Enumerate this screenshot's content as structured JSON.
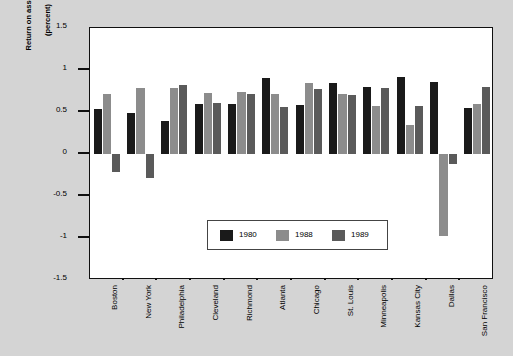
{
  "chart_data": {
    "type": "bar",
    "title": "",
    "subtitle": "",
    "xlabel": "",
    "ylabel": "Return on assets\n(percent)",
    "ylabel_lines": [
      "Return on assets",
      "(percent)"
    ],
    "ylim": [
      -1.5,
      1.5
    ],
    "yticks": [
      1.5,
      1,
      0.5,
      0,
      -0.5,
      -1,
      -1.5
    ],
    "ytick_labels": [
      "1.5",
      "1",
      "0.5",
      "0",
      "-0.5",
      "-1",
      "-1.5"
    ],
    "grid": false,
    "legend_position": "inside-bottom-center",
    "categories": [
      "Boston",
      "New York",
      "Philadelphia",
      "Cleveland",
      "Richmond",
      "Atlanta",
      "Chicago",
      "St. Louis",
      "Minneapolis",
      "Kansas City",
      "Dallas",
      "San Francisco"
    ],
    "series": [
      {
        "name": "1980",
        "color": "#1a1a1a",
        "values": [
          0.53,
          0.49,
          0.39,
          0.6,
          0.59,
          0.91,
          0.58,
          0.85,
          0.8,
          0.92,
          0.86,
          0.55
        ]
      },
      {
        "name": "1988",
        "color": "#8c8c8c",
        "values": [
          0.72,
          0.78,
          0.79,
          0.73,
          0.74,
          0.71,
          0.85,
          0.72,
          0.57,
          0.35,
          -0.98,
          0.6
        ]
      },
      {
        "name": "1989",
        "color": "#5a5a5a",
        "values": [
          -0.21,
          -0.28,
          0.82,
          0.61,
          0.71,
          0.56,
          0.77,
          0.7,
          0.78,
          0.57,
          -0.12,
          0.8
        ]
      }
    ]
  },
  "legend": {
    "entries": [
      {
        "label": "1980",
        "color": "#1a1a1a"
      },
      {
        "label": "1988",
        "color": "#8c8c8c"
      },
      {
        "label": "1989",
        "color": "#5a5a5a"
      }
    ]
  },
  "colors": {
    "background": "#d4d4d4",
    "plot_background": "#ffffff",
    "axis": "#111111",
    "series_1980": "#1a1a1a",
    "series_1988": "#8c8c8c",
    "series_1989": "#5a5a5a"
  }
}
